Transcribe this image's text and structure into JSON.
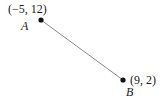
{
  "diagram": {
    "points": [
      {
        "name": "A",
        "coords_label": "(−5, 12)",
        "x": -5,
        "y": 12
      },
      {
        "name": "B",
        "coords_label": "(9, 2)",
        "x": 9,
        "y": 2
      }
    ],
    "segment": {
      "from": "A",
      "to": "B"
    },
    "colors": {
      "line": "#8a8a8a",
      "point": "#111111",
      "text": "#1a1a1a"
    }
  }
}
